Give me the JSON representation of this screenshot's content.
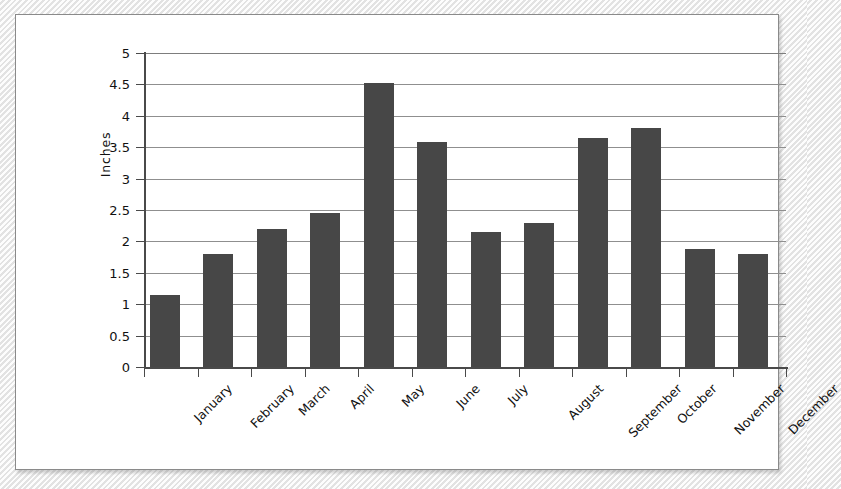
{
  "chart_data": {
    "type": "bar",
    "title": "",
    "xlabel": "",
    "ylabel": "Inches",
    "categories": [
      "January",
      "February",
      "March",
      "April",
      "May",
      "June",
      "July",
      "August",
      "September",
      "October",
      "November",
      "December"
    ],
    "values": [
      1.15,
      1.8,
      2.2,
      2.45,
      4.52,
      3.58,
      2.15,
      2.3,
      3.65,
      3.8,
      1.88,
      1.8
    ],
    "ylim": [
      0,
      5
    ],
    "ytick_labels": [
      "5",
      "4.5",
      "4",
      "3.5",
      "3",
      "2.5",
      "2",
      "1.5",
      "1",
      "0.5",
      "0"
    ],
    "ytick_values": [
      5,
      4.5,
      4,
      3.5,
      3,
      2.5,
      2,
      1.5,
      1,
      0.5,
      0
    ],
    "grid": true,
    "legend": false,
    "legend_position": "none",
    "series": [
      {
        "name": "Inches",
        "color": "#474747",
        "values": [
          1.15,
          1.8,
          2.2,
          2.45,
          4.52,
          3.58,
          2.15,
          2.3,
          3.65,
          3.8,
          1.88,
          1.8
        ]
      }
    ]
  },
  "colors": {
    "bar": "#474747",
    "axis": "#4a4a4a",
    "grid": "#8f8f8f",
    "panel_background": "#ffffff",
    "panel_border": "#8a8a8a",
    "page_background": "#f2f2f2",
    "text": "#111111"
  }
}
